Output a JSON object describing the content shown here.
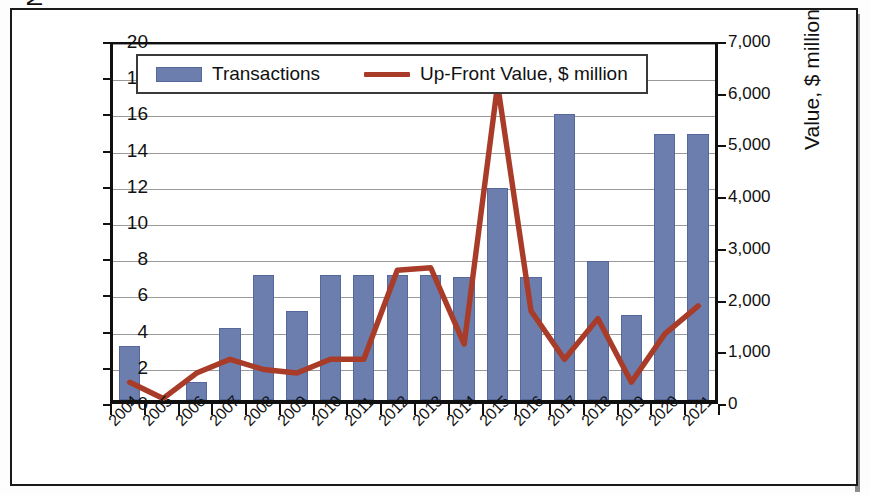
{
  "chart_data": {
    "type": "bar",
    "title": "",
    "subtitle": "",
    "xlabel": "",
    "ylabel": "Number of Transactions",
    "ylabel_right": "Value, $ million",
    "categories": [
      "2004",
      "2005",
      "2006",
      "2007",
      "2008",
      "2009",
      "2010",
      "2011",
      "2012",
      "2013",
      "2014",
      "2015",
      "2016",
      "2017",
      "2018",
      "2019",
      "2020",
      "2021"
    ],
    "ylim": [
      0,
      20
    ],
    "ylim_right": [
      0,
      7000
    ],
    "yticks": [
      "0",
      "2",
      "4",
      "6",
      "8",
      "10",
      "12",
      "14",
      "16",
      "18",
      "20"
    ],
    "yticks_right": [
      "0",
      "1,000",
      "2,000",
      "3,000",
      "4,000",
      "5,000",
      "6,000",
      "7,000"
    ],
    "grid": true,
    "legend_position": "top-left",
    "series": [
      {
        "name": "Transactions",
        "type": "bar",
        "axis": "left",
        "color": "#6b7ead",
        "values": [
          3,
          0,
          1,
          4,
          6.9,
          4.9,
          6.9,
          6.9,
          6.9,
          6.9,
          6.8,
          11.7,
          6.8,
          15.8,
          7.7,
          4.7,
          14.7,
          14.7
        ]
      },
      {
        "name": "Up-Front Value, $ million",
        "type": "line",
        "axis": "right",
        "color": "#a83c29",
        "values": [
          350,
          30,
          530,
          800,
          600,
          530,
          800,
          800,
          2550,
          2600,
          1100,
          6200,
          1750,
          800,
          1600,
          350,
          1300,
          1850
        ]
      }
    ]
  },
  "legend": {
    "entries": [
      {
        "label": "Transactions",
        "marker": "bar-swatch",
        "color": "#6b7ead"
      },
      {
        "label": "Up-Front Value, $ million",
        "marker": "line-swatch",
        "color": "#a83c29"
      }
    ]
  },
  "colors": {
    "bar": "#6b7ead",
    "line": "#a83c29",
    "grid": "#9a9a9a",
    "axis": "#101010",
    "frame": "#1a1a1a",
    "background": "#ffffff"
  }
}
